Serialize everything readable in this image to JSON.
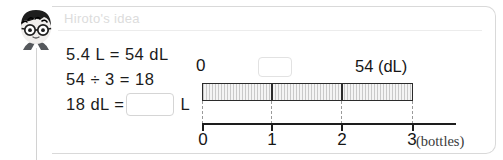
{
  "header": {
    "title": "Hiroto's idea",
    "avatar_name": "student-avatar-boy-glasses"
  },
  "equations": {
    "line1": "5.4 L = 54 dL",
    "line2": "54 ÷ 3 = 18",
    "line3_prefix": "18 dL =",
    "line3_unit": "L",
    "answer_value": ""
  },
  "diagram": {
    "top_axis": {
      "start_label": "0",
      "unknown_value": "",
      "end_label": "54 (dL)"
    },
    "bottom_axis": {
      "ticks": [
        "0",
        "1",
        "2",
        "3"
      ],
      "unit_label": "(bottles)"
    },
    "bar": {
      "segments": 3,
      "fill_hex": "#eeeeee",
      "hatch_hex": "#c9c9c9",
      "outline_hex": "#2b2b2b"
    }
  },
  "colors": {
    "text": "#161616",
    "muted_title": "#dcdcdc",
    "panel_border": "#d9d9d9",
    "input_border": "#d5d5d5"
  }
}
